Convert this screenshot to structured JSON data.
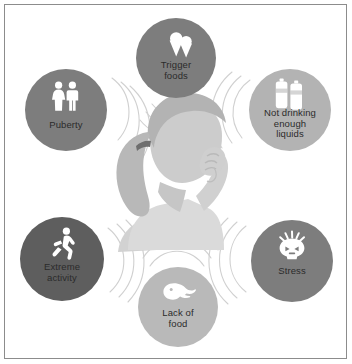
{
  "poster": {
    "background_color": "#ffffff",
    "border_color": "#8c8c8c",
    "label_text_color": "#2b2b2b"
  },
  "center": {
    "figure_name": "girl-with-headache-silhouette",
    "description": "Grayscale silhouette of a girl with a ponytail holding her head",
    "skin_color": "#c9c9c9",
    "hair_color": "#b0b0b0",
    "shirt_color": "#d6d6d6"
  },
  "nodes": [
    {
      "id": "trigger-foods",
      "label": "Trigger\nfoods",
      "icon": "ice-cream-cones-icon",
      "circle_color": "#7d7d7d",
      "icon_color": "#ffffff",
      "cx": 176,
      "cy": 58,
      "r": 40,
      "label_y": 60,
      "arc_angle": 90,
      "arc_radius_start": 46
    },
    {
      "id": "not-drinking-enough-liquids",
      "label": "Not drinking\nenough\nliquids",
      "icon": "water-bottles-icon",
      "circle_color": "#b3b3b3",
      "icon_color": "#ffffff",
      "cx": 290,
      "cy": 110,
      "r": 41,
      "label_y": 108,
      "arc_angle": 200,
      "arc_radius_start": 47
    },
    {
      "id": "stress",
      "label": "Stress",
      "icon": "stressed-head-icon",
      "circle_color": "#7d7d7d",
      "icon_color": "#ffffff",
      "cx": 292,
      "cy": 261,
      "r": 41,
      "label_y": 266,
      "arc_angle": 170,
      "arc_radius_start": 47
    },
    {
      "id": "lack-of-food",
      "label": "Lack of\nfood",
      "icon": "empty-plate-icon",
      "circle_color": "#b9b9b9",
      "icon_color": "#ffffff",
      "cx": 178,
      "cy": 307,
      "r": 40,
      "label_y": 308,
      "arc_angle": 270,
      "arc_radius_start": 46
    },
    {
      "id": "extreme-activity",
      "label": "Extreme\nactivity",
      "icon": "running-person-icon",
      "circle_color": "#5e5e5e",
      "icon_color": "#ffffff",
      "cx": 62,
      "cy": 259,
      "r": 42,
      "label_y": 262,
      "arc_angle": 10,
      "arc_radius_start": 48
    },
    {
      "id": "puberty",
      "label": "Puberty",
      "icon": "boy-and-girl-icon",
      "circle_color": "#7d7d7d",
      "icon_color": "#ffffff",
      "cx": 66,
      "cy": 110,
      "r": 41,
      "label_y": 120,
      "arc_angle": 350,
      "arc_radius_start": 47
    }
  ]
}
